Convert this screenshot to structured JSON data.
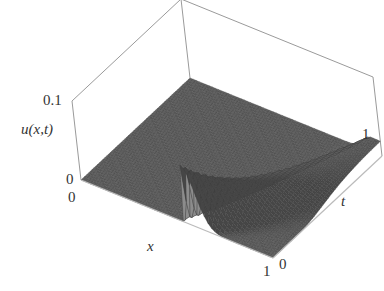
{
  "chart_data": {
    "type": "surface3d",
    "title": "",
    "function_label": "u(x,t)",
    "axes": {
      "x": {
        "label": "x",
        "range": [
          0,
          1
        ],
        "ticks": [
          "0",
          "1"
        ]
      },
      "t": {
        "label": "t",
        "range": [
          0,
          1
        ],
        "ticks": [
          "0",
          "1"
        ]
      },
      "u": {
        "label": "u(x,t)",
        "range": [
          0,
          0.1
        ],
        "ticks": [
          "0",
          "0.1"
        ]
      }
    },
    "surface_samples": {
      "x": [
        0,
        0.2,
        0.4,
        0.5,
        0.55,
        0.6,
        0.7,
        0.8,
        0.9,
        1.0
      ],
      "t": [
        0,
        0.1,
        0.25,
        0.5,
        0.75,
        1.0
      ],
      "note": "approximate peak height along ridge",
      "ridge": [
        {
          "t": 0.05,
          "x": 0.56,
          "u": 0.07
        },
        {
          "t": 0.25,
          "x": 0.65,
          "u": 0.045
        },
        {
          "t": 0.5,
          "x": 0.78,
          "u": 0.03
        },
        {
          "t": 0.75,
          "x": 0.88,
          "u": 0.022
        },
        {
          "t": 1.0,
          "x": 0.95,
          "u": 0.018
        }
      ]
    },
    "box": true,
    "grid": false,
    "mesh_color": "#4a4a4a",
    "box_color": "#9a9a9a"
  },
  "labels": {
    "u_top": "0.1",
    "u_bottom": "0",
    "x_start": "0",
    "x_end": "1",
    "t_start": "0",
    "t_end": "1",
    "u_axis": "u(x,t)",
    "x_axis": "x",
    "t_axis": "t"
  }
}
